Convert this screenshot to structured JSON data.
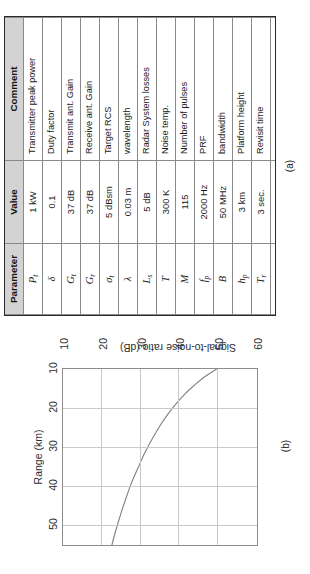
{
  "figure": {
    "panel_a_caption": "(a)",
    "panel_b_caption": "(b)"
  },
  "table": {
    "headers": [
      "Parameter",
      "Value",
      "Comment"
    ],
    "rows": [
      {
        "symbol": "P",
        "subscript": "t",
        "value": "1 kW",
        "comment": "Transmitter peak power"
      },
      {
        "symbol": "δ",
        "subscript": "",
        "value": "0.1",
        "comment": "Duty factor"
      },
      {
        "symbol": "G",
        "subscript": "t",
        "value": "37 dB",
        "comment": "Transmit ant. Gain"
      },
      {
        "symbol": "G",
        "subscript": "r",
        "value": "37 dB",
        "comment": "Receive ant. Gain"
      },
      {
        "symbol": "σ",
        "subscript": "t",
        "value": "5 dBsm",
        "comment": "Target RCS"
      },
      {
        "symbol": "λ",
        "subscript": "",
        "value": "0.03 m",
        "comment": "wavelength"
      },
      {
        "symbol": "L",
        "subscript": "s",
        "value": "5 dB",
        "comment": "Radar System losses"
      },
      {
        "symbol": "T",
        "subscript": "",
        "value": "300 K",
        "comment": "Noise temp."
      },
      {
        "symbol": "M",
        "subscript": "",
        "value": "115",
        "comment": "Number of pulses"
      },
      {
        "symbol": "f",
        "subscript": "p",
        "value": "2000 Hz",
        "comment": "PRF"
      },
      {
        "symbol": "B",
        "subscript": "",
        "value": "50 MHz",
        "comment": "bandwidth"
      },
      {
        "symbol": "h",
        "subscript": "p",
        "value": "3 km",
        "comment": "Platform height"
      },
      {
        "symbol": "T",
        "subscript": "r",
        "value": "3 sec.",
        "comment": "Revisit time"
      },
      {
        "symbol": "F",
        "subscript": "n",
        "value": "5 dB",
        "comment": "Noise factor"
      }
    ]
  },
  "chart_data": {
    "type": "line",
    "title": "",
    "xlabel": "Range (km)",
    "ylabel": "Signal-to-noise ratio (dB)",
    "xlim": [
      10,
      55
    ],
    "ylim": [
      10,
      60
    ],
    "xticks": [
      10,
      20,
      30,
      40,
      50
    ],
    "yticks": [
      10,
      20,
      30,
      40,
      50,
      60
    ],
    "xtick_labels": [
      "10",
      "20",
      "30",
      "40",
      "50"
    ],
    "ytick_labels": [
      "10",
      "20",
      "30",
      "40",
      "50",
      "60"
    ],
    "grid": true,
    "legend": "none",
    "line_color": "#7f7f7f",
    "series": [
      {
        "name": "SNR vs Range",
        "x": [
          10,
          12,
          14,
          16,
          18,
          20,
          22,
          24,
          26,
          28,
          30,
          32,
          34,
          36,
          38,
          40,
          42,
          44,
          46,
          48,
          50,
          52,
          55
        ],
        "y": [
          49.6,
          46.5,
          44.0,
          41.8,
          39.9,
          38.2,
          36.7,
          35.3,
          34.1,
          32.9,
          31.8,
          30.8,
          29.9,
          29.0,
          28.1,
          27.3,
          26.6,
          25.9,
          25.2,
          24.6,
          24.0,
          23.4,
          22.6
        ]
      }
    ]
  }
}
